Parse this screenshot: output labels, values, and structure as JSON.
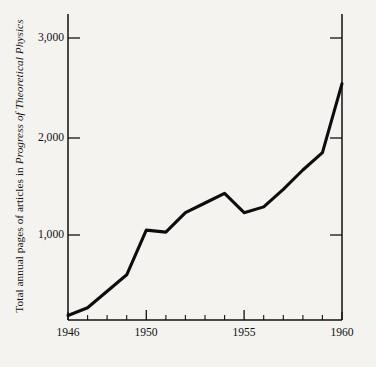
{
  "chart_data": {
    "type": "line",
    "title": "",
    "subtitle": "",
    "xlabel": "",
    "ylabel": "Total annual pages of articles in Progress of Theoretical Physics",
    "ylabel_plain_prefix": "Total annual pages of articles in ",
    "ylabel_italic_part": "Progress of Theoretical Physics",
    "x": [
      1946,
      1947,
      1948,
      1949,
      1950,
      1951,
      1952,
      1953,
      1954,
      1955,
      1956,
      1957,
      1958,
      1959,
      1960
    ],
    "values": [
      170,
      250,
      420,
      590,
      1050,
      1030,
      1230,
      1330,
      1430,
      1230,
      1290,
      1470,
      1670,
      1850,
      2560
    ],
    "series": [
      {
        "name": "Total annual pages",
        "values": [
          170,
          250,
          420,
          590,
          1050,
          1030,
          1230,
          1330,
          1430,
          1230,
          1290,
          1470,
          1670,
          1850,
          2560
        ]
      }
    ],
    "xlim": [
      1946,
      1960
    ],
    "ylim": [
      0,
      3200
    ],
    "xticks": [
      1946,
      1947,
      1948,
      1949,
      1950,
      1951,
      1952,
      1953,
      1954,
      1955,
      1956,
      1957,
      1958,
      1959,
      1960
    ],
    "xtick_labels_shown": [
      "1946",
      "1950",
      "1955",
      "1960"
    ],
    "yticks": [
      1000,
      2000,
      3000
    ],
    "ytick_labels": [
      "1,000",
      "2,000",
      "3,000"
    ],
    "grid": false,
    "legend": false,
    "legend_position": "none",
    "line_color": "#0d0d0d",
    "background_color": "#f5f3ef",
    "axis_color": "#111111",
    "axes_drawn": [
      "left",
      "right",
      "bottom"
    ]
  },
  "axis": {
    "y_tick_labels": [
      {
        "text": "3,000",
        "value": 3000
      },
      {
        "text": "2,000",
        "value": 2000
      },
      {
        "text": "1,000",
        "value": 1000
      }
    ],
    "x_tick_labels": [
      {
        "text": "1946",
        "value": 1946
      },
      {
        "text": "1950",
        "value": 1950
      },
      {
        "text": "1955",
        "value": 1955
      },
      {
        "text": "1960",
        "value": 1960
      }
    ]
  }
}
